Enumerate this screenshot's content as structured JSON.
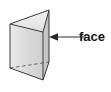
{
  "figure": {
    "kind": "geometry-diagram",
    "canvas": {
      "width": 111,
      "height": 92,
      "background": "#ffffff"
    },
    "solid": {
      "name": "triangular-prism",
      "fill_front": "#d8d8d8",
      "fill_right": "#c6c6c6",
      "fill_top": "#efefef",
      "fill_bottom": "#e4e4e4",
      "stroke": "#3b3b3b",
      "stroke_width": 1,
      "hidden_edge_style": "dashed",
      "vertices": {
        "top_left": [
          10,
          24
        ],
        "top_back": [
          49,
          10
        ],
        "top_front": [
          43,
          32
        ],
        "bottom_left": [
          10,
          68
        ],
        "bottom_back": [
          49,
          62
        ],
        "bottom_front": [
          43,
          80
        ]
      }
    },
    "annotation": {
      "label": "face",
      "label_color": "#111111",
      "label_x": 79,
      "label_y": 30,
      "leader": {
        "name": "leader-line",
        "color": "#6a6a6a",
        "from": [
          86,
          37
        ],
        "to": [
          50,
          37
        ],
        "arrow_head": "left"
      }
    }
  }
}
